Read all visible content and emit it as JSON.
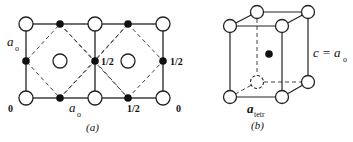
{
  "panel_a": {
    "caption": "(a)",
    "label_ao_left": "a",
    "label_ao_left_sub": "o",
    "label_ao_bottom": "a",
    "label_ao_bottom_sub": "o",
    "height_labels": {
      "bottom_left": "0",
      "bottom_right": "0",
      "bottom_mid": "1/2",
      "center_right": "1/2",
      "far_right": "1/2"
    }
  },
  "panel_b": {
    "caption": "(b)",
    "c_label": "c = a",
    "c_label_sub": "o",
    "a_label": "a",
    "a_label_sub": "tetr"
  }
}
